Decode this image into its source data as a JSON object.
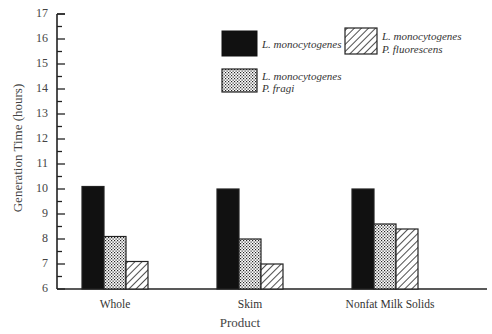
{
  "chart_data": {
    "type": "bar",
    "title": "",
    "xlabel": "Product",
    "ylabel": "Generation Time (hours)",
    "ylim": [
      6,
      17
    ],
    "yticks": [
      6,
      7,
      8,
      9,
      10,
      11,
      12,
      13,
      14,
      15,
      16,
      17
    ],
    "grid": false,
    "legend_position": "upper right inside",
    "categories": [
      "Whole",
      "Skim",
      "Nonfat Milk Solids"
    ],
    "series": [
      {
        "name": "L. monocytogenes",
        "pattern": "solid-black",
        "values": [
          10.1,
          10.0,
          10.0
        ]
      },
      {
        "name": "L. monocytogenes + P. fragi",
        "pattern": "dots",
        "values": [
          8.1,
          8.0,
          8.6
        ]
      },
      {
        "name": "L. monocytogenes + P. fluorescens",
        "pattern": "diagonal-hatch",
        "values": [
          7.1,
          7.0,
          8.4
        ]
      }
    ]
  },
  "legend": {
    "item1": {
      "line1": "L. monocytogenes"
    },
    "item2": {
      "line1": "L. monocytogenes",
      "line2": "P. fluorescens"
    },
    "item3": {
      "line1": "L. monocytogenes",
      "line2": "P. fragi"
    }
  },
  "axis": {
    "ylabel": "Generation Time (hours)",
    "xlabel": "Product",
    "ticks": [
      "6",
      "7",
      "8",
      "9",
      "10",
      "11",
      "12",
      "13",
      "14",
      "15",
      "16",
      "17"
    ],
    "categories": [
      "Whole",
      "Skim",
      "Nonfat Milk Solids"
    ]
  }
}
